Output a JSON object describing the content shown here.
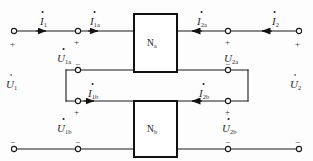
{
  "figure": {
    "stroke_color": "#1a1a1a",
    "text_color": "#2a2a2a"
  },
  "blocks": [
    {
      "id": "Na",
      "letter": "N",
      "subscript": "a"
    },
    {
      "id": "Nb",
      "letter": "N",
      "subscript": "b"
    }
  ],
  "currents": [
    {
      "id": "i1",
      "letter": "I",
      "subscript": "1",
      "dot": true,
      "direction": "right"
    },
    {
      "id": "i1a",
      "letter": "I",
      "subscript": "1a",
      "dot": true,
      "direction": "right"
    },
    {
      "id": "i2a",
      "letter": "I",
      "subscript": "2a",
      "dot": true,
      "direction": "left"
    },
    {
      "id": "i2",
      "letter": "I",
      "subscript": "2",
      "dot": true,
      "direction": "left"
    },
    {
      "id": "i1b",
      "letter": "I",
      "subscript": "1b",
      "dot": true,
      "direction": "right"
    },
    {
      "id": "i2b",
      "letter": "I",
      "subscript": "2b",
      "dot": true,
      "direction": "left"
    }
  ],
  "voltages": [
    {
      "id": "u1",
      "letter": "U",
      "subscript": "1",
      "dot": true
    },
    {
      "id": "u1a",
      "letter": "U",
      "subscript": "1a",
      "dot": true
    },
    {
      "id": "u2a",
      "letter": "U",
      "subscript": "2a",
      "dot": false
    },
    {
      "id": "u1b",
      "letter": "U",
      "subscript": "1b",
      "dot": true
    },
    {
      "id": "u2b",
      "letter": "U",
      "subscript": "2b",
      "dot": true
    },
    {
      "id": "u2",
      "letter": "U",
      "subscript": "2",
      "dot": true
    }
  ],
  "polarity_marks": [
    {
      "id": "p-left-top",
      "sign": "+"
    },
    {
      "id": "p-u1a-top",
      "sign": "+"
    },
    {
      "id": "p-u1a-bottom",
      "sign": "−"
    },
    {
      "id": "p-u2a-top",
      "sign": "+"
    },
    {
      "id": "p-u2a-bottom",
      "sign": "−"
    },
    {
      "id": "p-right-top",
      "sign": "+"
    },
    {
      "id": "p-u1b-top",
      "sign": "+"
    },
    {
      "id": "p-u1b-bottom",
      "sign": "−"
    },
    {
      "id": "p-u2b-top",
      "sign": "+"
    },
    {
      "id": "p-u2b-bottom",
      "sign": "−"
    },
    {
      "id": "p-left-bottom",
      "sign": "−"
    },
    {
      "id": "p-right-bottom",
      "sign": "−"
    }
  ]
}
